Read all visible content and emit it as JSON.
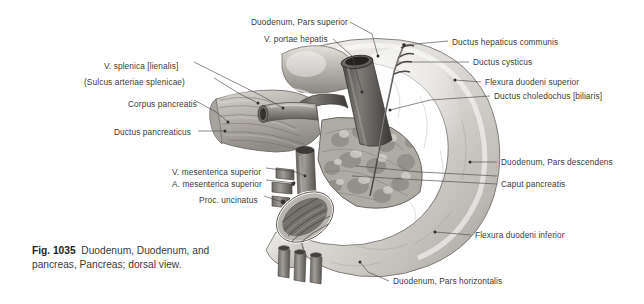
{
  "figure": {
    "number": "Fig. 1035",
    "caption": "Duodenum, Duodenum, and pancreas, Pancreas; dorsal view.",
    "background_color": "#ffffff",
    "text_color": "#3b3b3b",
    "leader_color": "#4a4a4a"
  },
  "labels": {
    "left": [
      {
        "id": "v-splenica",
        "text": "V. splenica [lienalis]",
        "x": 104,
        "y": 62,
        "anchor_x": 283,
        "anchor_y": 108
      },
      {
        "id": "sulcus-splenicae",
        "text": "(Sulcus arteriae splenicae)",
        "x": 84,
        "y": 78,
        "anchor_x": 258,
        "anchor_y": 103
      },
      {
        "id": "corpus-pancreatis",
        "text": "Corpus pancreatis",
        "x": 128,
        "y": 100,
        "anchor_x": 228,
        "anchor_y": 122
      },
      {
        "id": "ductus-pancreaticus",
        "text": "Ductus pancreaticus",
        "x": 114,
        "y": 128,
        "anchor_x": 225,
        "anchor_y": 131
      },
      {
        "id": "v-mesenterica-sup",
        "text": "V. mesenterica superior",
        "x": 172,
        "y": 168,
        "anchor_x": 305,
        "anchor_y": 176
      },
      {
        "id": "a-mesenterica-sup",
        "text": "A. mesenterica superior",
        "x": 172,
        "y": 180,
        "anchor_x": 294,
        "anchor_y": 183
      },
      {
        "id": "proc-uncinatus",
        "text": "Proc. uncinatus",
        "x": 199,
        "y": 196,
        "anchor_x": 283,
        "anchor_y": 202
      }
    ],
    "top": [
      {
        "id": "duodenum-pars-superior",
        "text": "Duodenum, Pars superior",
        "x": 251,
        "y": 18,
        "anchor_x": 378,
        "anchor_y": 56
      },
      {
        "id": "v-portae-hepatis",
        "text": "V. portae hepatis",
        "x": 264,
        "y": 35,
        "anchor_x": 362,
        "anchor_y": 92
      }
    ],
    "right": [
      {
        "id": "ductus-hepaticus-communis",
        "text": "Ductus hepaticus communis",
        "x": 452,
        "y": 38,
        "anchor_x": 404,
        "anchor_y": 45
      },
      {
        "id": "ductus-cysticus",
        "text": "Ductus cysticus",
        "x": 473,
        "y": 60,
        "anchor_x": 398,
        "anchor_y": 62
      },
      {
        "id": "flexura-duodeni-superior",
        "text": "Flexura duodeni superior",
        "x": 485,
        "y": 80,
        "anchor_x": 455,
        "anchor_y": 80
      },
      {
        "id": "ductus-choledochus",
        "text": "Ductus choledochus [biliaris]",
        "x": 494,
        "y": 94,
        "anchor_x": 390,
        "anchor_y": 110
      },
      {
        "id": "duodenum-pars-descendens",
        "text": "Duodenum, Pars descendens",
        "x": 501,
        "y": 160,
        "anchor_x": 470,
        "anchor_y": 162
      },
      {
        "id": "caput-pancreatis",
        "text": "Caput pancreatis",
        "x": 501,
        "y": 182,
        "anchor_x": 352,
        "anchor_y": 176
      },
      {
        "id": "flexura-duodeni-inferior",
        "text": "Flexura duodeni inferior",
        "x": 475,
        "y": 233,
        "anchor_x": 435,
        "anchor_y": 232
      },
      {
        "id": "duodenum-pars-horizontalis",
        "text": "Duodenum, Pars horizontalis",
        "x": 393,
        "y": 281,
        "anchor_x": 360,
        "anchor_y": 262
      }
    ]
  }
}
